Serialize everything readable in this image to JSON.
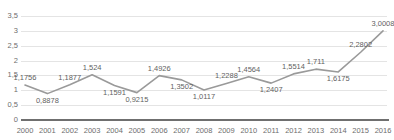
{
  "chart_data": {
    "type": "line",
    "title": "",
    "xlabel": "",
    "ylabel": "",
    "categories": [
      "2000",
      "2001",
      "2002",
      "2003",
      "2004",
      "2005",
      "2006",
      "2007",
      "2008",
      "2009",
      "2010",
      "2011",
      "2012",
      "2013",
      "2014",
      "2015",
      "2016"
    ],
    "values": [
      1.1756,
      0.8878,
      1.1877,
      1.524,
      1.1591,
      0.9215,
      1.4926,
      1.3502,
      1.0117,
      1.2288,
      1.4564,
      1.2407,
      1.5514,
      1.711,
      1.6175,
      2.2802,
      3.0008
    ],
    "point_labels": [
      "1,1756",
      "0,8878",
      "1,1877",
      "1,524",
      "1,1591",
      "0,9215",
      "1,4926",
      "1,3502",
      "1,0117",
      "1,2288",
      "1,4564",
      "1,2407",
      "1,5514",
      "1,711",
      "1,6175",
      "2,2802",
      "3,0008"
    ],
    "label_positions": [
      "above",
      "below",
      "above",
      "above",
      "below",
      "below",
      "above",
      "below",
      "below",
      "above",
      "above",
      "below",
      "above",
      "above",
      "below",
      "above",
      "above"
    ],
    "ylim": [
      0,
      3.5
    ],
    "ytick_values": [
      0,
      0.5,
      1,
      1.5,
      2,
      2.5,
      3,
      3.5
    ],
    "ytick_labels": [
      "0",
      "0,5",
      "1",
      "1,5",
      "2",
      "2,5",
      "3",
      "3,5"
    ],
    "grid": true,
    "legend": "none",
    "decimal_separator": ",",
    "series_color": "#9a9a9a",
    "gridline_color": "#e4e4e4",
    "axis_color": "#6f6f6f",
    "text_color": "#6d6d6d",
    "label_color": "#5f5f5f",
    "background_color": "#ffffff"
  },
  "top_remnant": {
    "text": ""
  }
}
